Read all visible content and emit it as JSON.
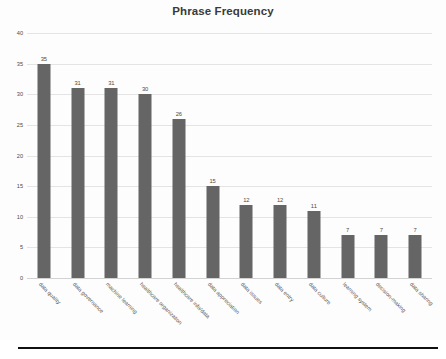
{
  "chart_data": {
    "type": "bar",
    "title": "Phrase Frequency",
    "subtitle": "",
    "xlabel": "",
    "ylabel": "",
    "categories": [
      "data quality",
      "data governance",
      "machine learning",
      "healthcare organization",
      "healthcare info/data",
      "data appreciation",
      "data issues",
      "data entry",
      "data culture",
      "learning system",
      "decision-making",
      "data sharing"
    ],
    "values": [
      35,
      31,
      31,
      30,
      26,
      15,
      12,
      12,
      11,
      7,
      7,
      7
    ],
    "value_labels": [
      "35",
      "31",
      "31",
      "30",
      "26",
      "15",
      "12",
      "12",
      "11",
      "7",
      "7",
      "7"
    ],
    "ylim": [
      0,
      40
    ],
    "ytick_values": [
      0,
      5,
      10,
      15,
      20,
      25,
      30,
      35,
      40
    ],
    "ytick_labels": [
      "0",
      "5",
      "10",
      "15",
      "20",
      "25",
      "30",
      "35",
      "40"
    ],
    "grid": true,
    "legend": false,
    "legend_position": "none",
    "bar_color": "#656565",
    "grid_color": "#e4e4e4",
    "title_color": "#3a3a3a",
    "background_color": "#fdfdfd",
    "label_rotation_deg": 45
  },
  "footer": {
    "rule_color": "#111111"
  }
}
